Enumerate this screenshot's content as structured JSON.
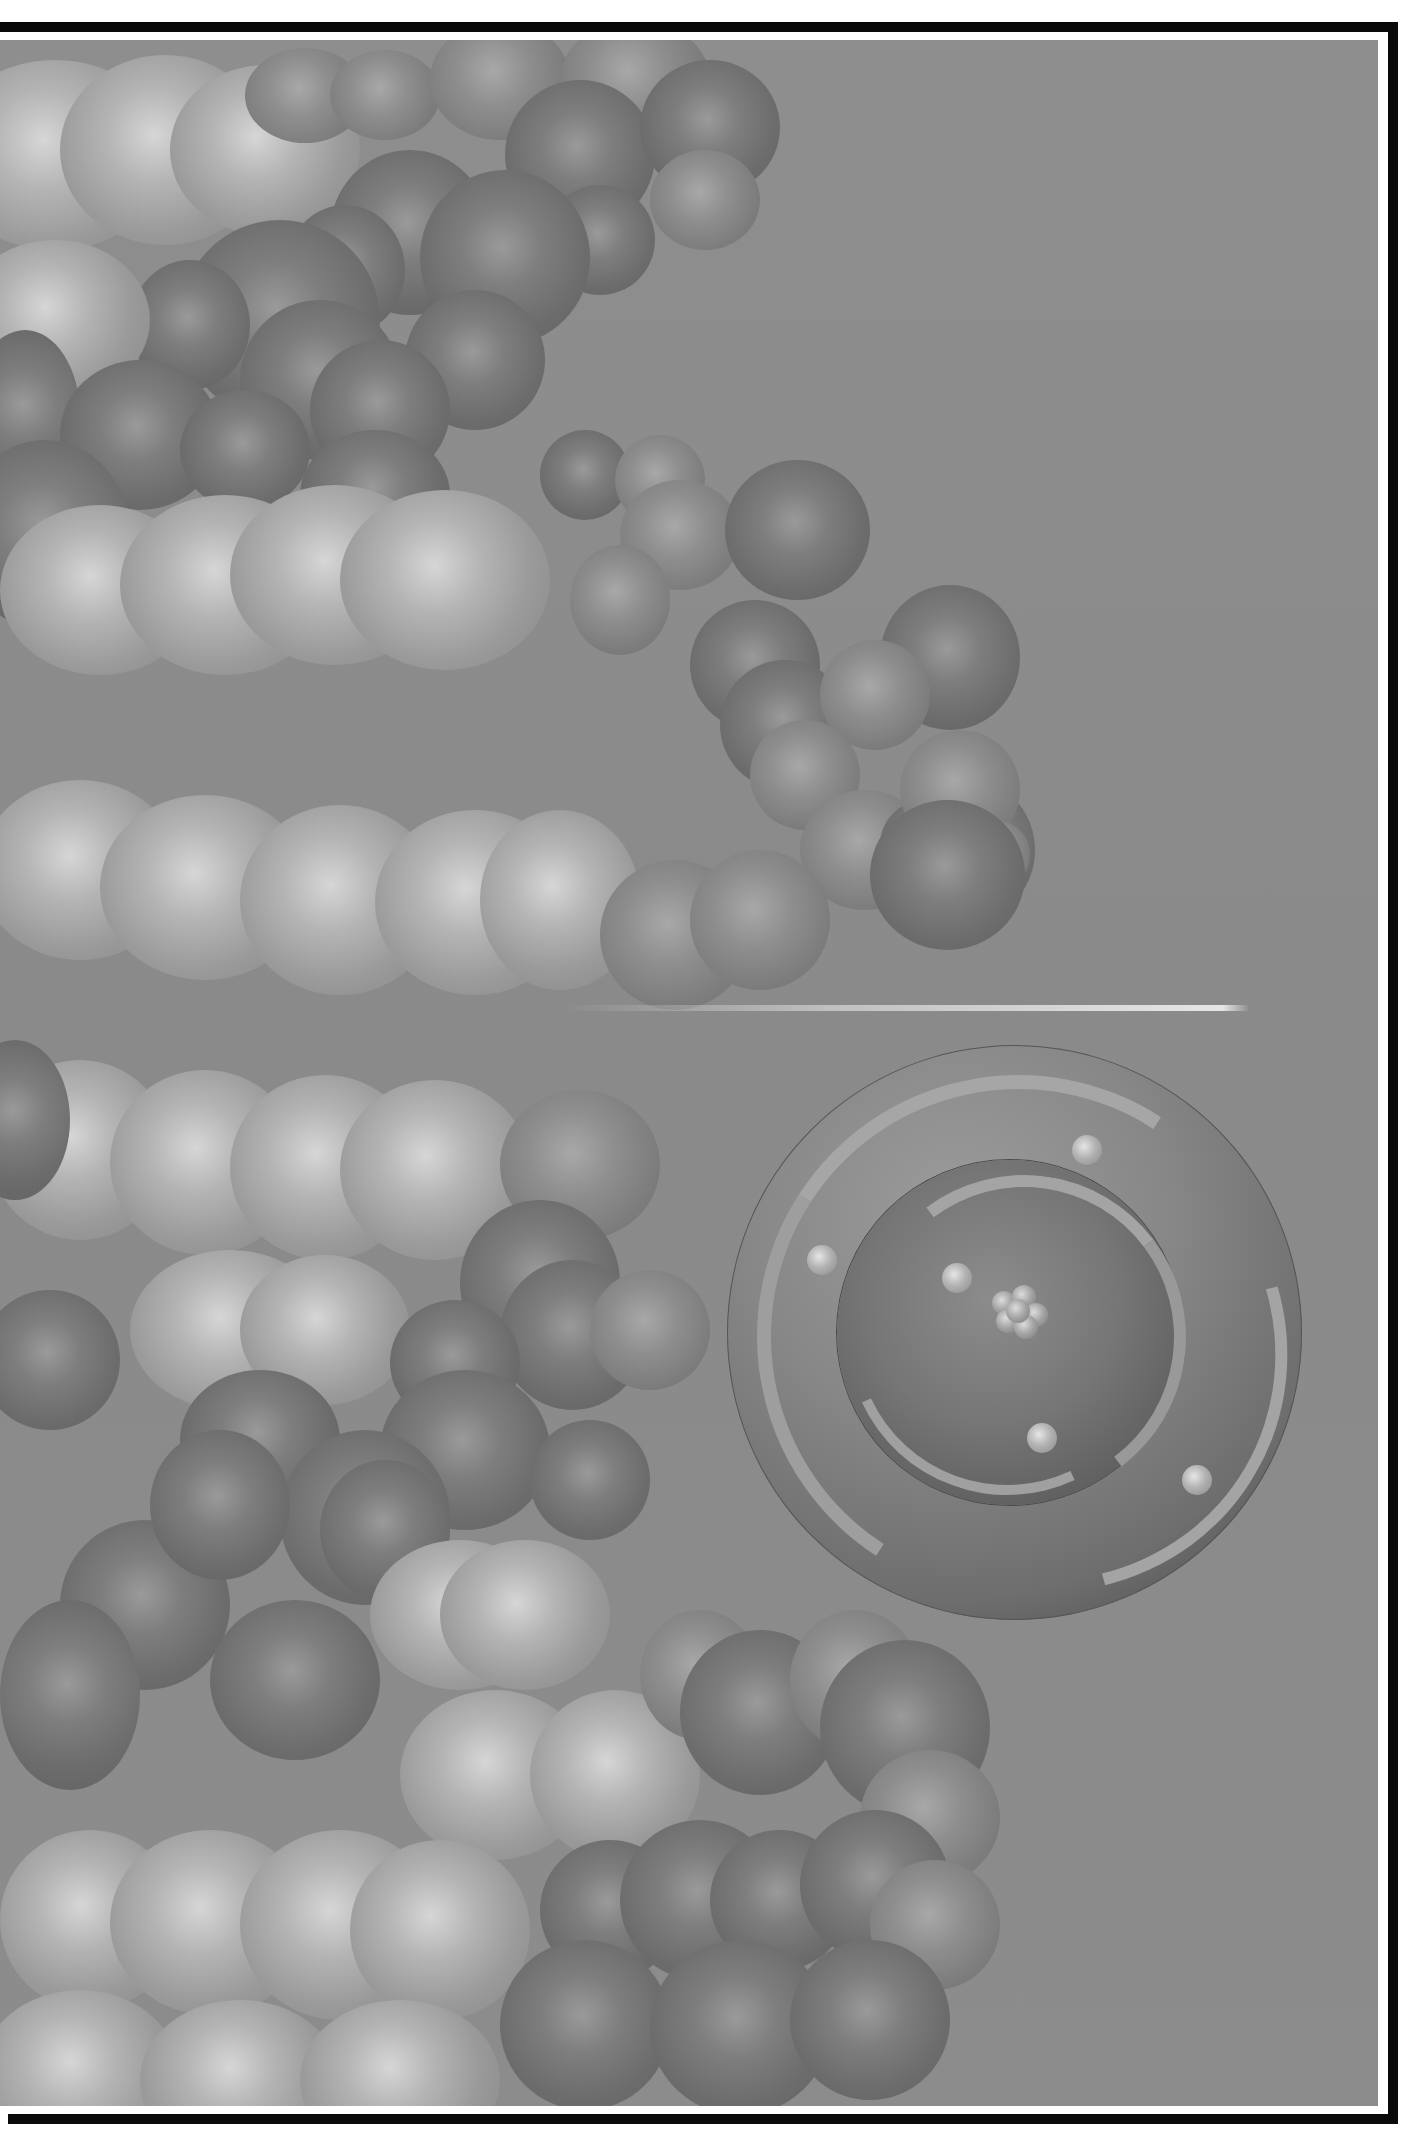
{
  "illustration": {
    "subject": "DNA double helix space-filling model with atom model",
    "palette": {
      "background": "#8c8c8c",
      "frame": "#0a0a0a",
      "margin": "#ffffff",
      "light_sphere": "#b4b4b4",
      "dark_sphere": "#6c6c6c"
    },
    "elements": {
      "helix": "space-filling DNA helix",
      "atom": "atom model with two electron shells",
      "electrons_visible": 5,
      "nucleus": "nucleus cluster"
    }
  }
}
